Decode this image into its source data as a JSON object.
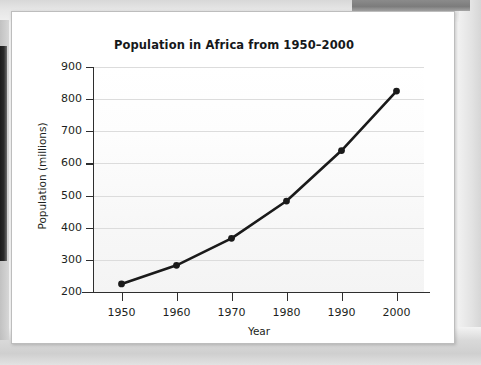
{
  "chart_data": {
    "type": "line",
    "title": "Population in Africa from 1950–2000",
    "xlabel": "Year",
    "ylabel": "Population (millions)",
    "x": [
      1950,
      1960,
      1970,
      1980,
      1990,
      2000
    ],
    "categories": [
      "1950",
      "1960",
      "1970",
      "1980",
      "1990",
      "2000"
    ],
    "values": [
      225,
      283,
      367,
      483,
      640,
      825
    ],
    "series": [
      {
        "name": "Population in Africa",
        "values": [
          225,
          283,
          367,
          483,
          640,
          825
        ]
      }
    ],
    "xlim": [
      1945,
      2005
    ],
    "ylim": [
      200,
      900
    ],
    "x_ticks": [
      "1950",
      "1960",
      "1970",
      "1980",
      "1990",
      "2000"
    ],
    "y_ticks": [
      "200",
      "300",
      "400",
      "500",
      "600",
      "700",
      "800",
      "900"
    ],
    "grid": true,
    "legend": false,
    "legend_position": "none",
    "marker": "filled-circle",
    "line_color": "#1a1a1a",
    "marker_color": "#1a1a1a",
    "gridline_color": "#dcdcdc",
    "axis_color": "#2e2e2e",
    "plot_background": "#fbfbfb",
    "page_background": "#ffffff"
  },
  "figure": {
    "title": "Population in Africa from 1950–2000",
    "x_axis_title": "Year",
    "y_axis_title": "Population (millions)"
  }
}
